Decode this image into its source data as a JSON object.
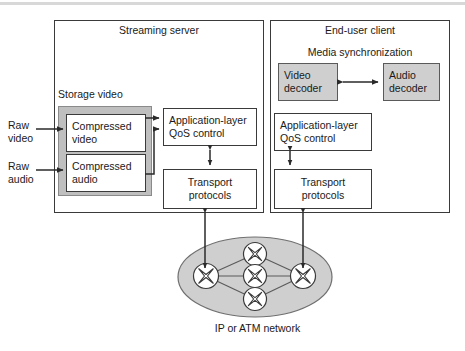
{
  "diagram": {
    "panels": {
      "server": {
        "label": "Streaming server"
      },
      "client": {
        "label": "End-user client"
      }
    },
    "server_section": {
      "storage_label": "Storage video",
      "compressed_video": {
        "line1": "Compressed",
        "line2": "video"
      },
      "compressed_audio": {
        "line1": "Compressed",
        "line2": "audio"
      },
      "qos": {
        "line1": "Application-layer",
        "line2": "QoS control"
      },
      "transport": {
        "line1": "Transport",
        "line2": "protocols"
      }
    },
    "client_section": {
      "media_sync_label": "Media synchronization",
      "video_decoder": {
        "line1": "Video",
        "line2": "decoder"
      },
      "audio_decoder": {
        "line1": "Audio",
        "line2": "decoder"
      },
      "qos": {
        "line1": "Application-layer",
        "line2": "QoS control"
      },
      "transport": {
        "line1": "Transport",
        "line2": "protocols"
      }
    },
    "inputs": {
      "raw_video": {
        "line1": "Raw",
        "line2": "video"
      },
      "raw_audio": {
        "line1": "Raw",
        "line2": "audio"
      }
    },
    "network": {
      "label": "IP or ATM network",
      "node_count": 5,
      "node_icon": "router-icon"
    },
    "colors": {
      "stroke": "#3a3a3a",
      "gray_fill": "#cfcfcf",
      "storage_fill": "#bfbfbf",
      "cloud_fill": "#cfcfcf",
      "background": "#ffffff"
    }
  }
}
